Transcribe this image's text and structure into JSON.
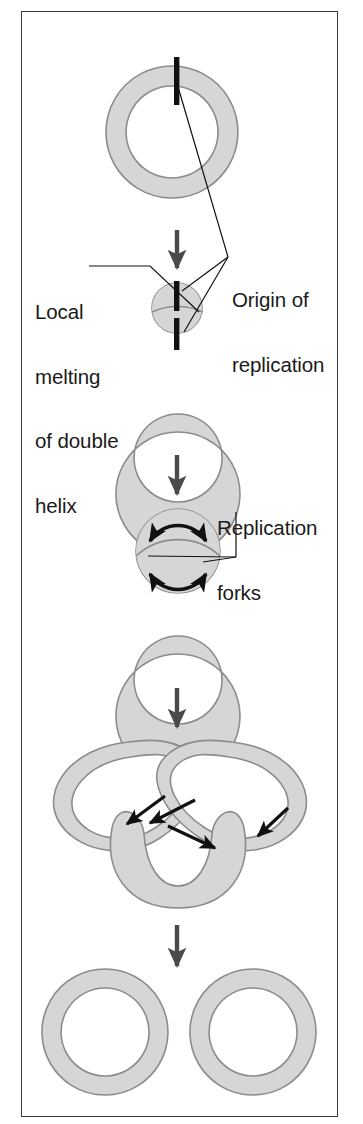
{
  "figure": {
    "background": "#ffffff",
    "frame_color": "#3b3b3b",
    "dna_fill": "#d6d6d6",
    "dna_stroke": "#8c8c8c",
    "origin_marker_color": "#111111",
    "process_arrow_color": "#4a4a4a",
    "fork_arrow_color": "#111111",
    "leader_line_color": "#111111",
    "text_color": "#1a1a1a"
  },
  "labels": {
    "origin": {
      "lines": [
        "Origin of",
        "replication"
      ],
      "line1": "Origin of",
      "line2": "replication",
      "x": 232,
      "y": 246
    },
    "local_melting": {
      "lines": [
        "Local",
        "melting",
        "of double",
        "helix"
      ],
      "line1": "Local",
      "line2": "melting",
      "line3": "of double",
      "line4": "helix",
      "x": 35,
      "y": 258
    },
    "replication_forks": {
      "lines": [
        "Replication",
        "forks"
      ],
      "line1": "Replication",
      "line2": "forks",
      "x": 217,
      "y": 474
    }
  },
  "stages": [
    {
      "id": "stage-1-intact-circle",
      "name": "Intact circular chromosome",
      "cx": 172,
      "cy": 132,
      "outer_r": 66,
      "inner_r": 46,
      "origin_markers": 1
    },
    {
      "id": "stage-2-local-melting",
      "name": "Local melting of double helix at origin",
      "cx": 178,
      "cy": 370,
      "outer_r": 62,
      "inner_r": 44,
      "bubble_cx": 177,
      "bubble_cy": 306,
      "bubble_r": 25,
      "origin_markers": 2
    },
    {
      "id": "stage-3-replication-bubble",
      "name": "Replication bubble with two forks",
      "cx": 178,
      "cy": 592,
      "outer_r": 62,
      "inner_r": 44,
      "bubble_cx": 178,
      "bubble_cy": 550,
      "bubble_r": 44,
      "fork_arrows": 2
    },
    {
      "id": "stage-4-theta-intermediate",
      "name": "Late theta intermediate, nearly complete daughter loops",
      "fork_arrows": 4
    },
    {
      "id": "stage-5-two-daughter-circles",
      "name": "Two separated daughter chromosomes",
      "left_cx": 105,
      "left_cy": 1032,
      "right_cx": 253,
      "right_cy": 1032,
      "outer_r": 63,
      "inner_r": 44
    }
  ],
  "process_arrows": [
    {
      "name": "arrow-stage1-to-stage2",
      "x": 177,
      "y1": 230,
      "y2": 274
    },
    {
      "name": "arrow-stage2-to-stage3",
      "x": 177,
      "y1": 455,
      "y2": 500
    },
    {
      "name": "arrow-stage3-to-stage4",
      "x": 177,
      "y1": 688,
      "y2": 733
    },
    {
      "name": "arrow-stage4-to-stage5",
      "x": 177,
      "y1": 925,
      "y2": 972
    }
  ]
}
